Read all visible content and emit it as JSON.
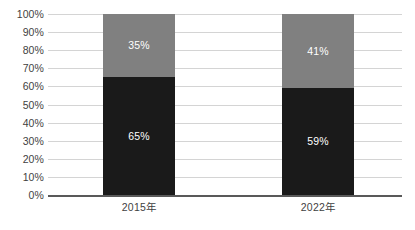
{
  "chart_data": {
    "type": "bar",
    "subtype": "100% stacked column",
    "title": "",
    "subtitle": "",
    "xlabel": "",
    "ylabel": "",
    "categories": [
      "2015年",
      "2022年"
    ],
    "series": [
      {
        "name": "dark-segment",
        "color": "#1a1a1a",
        "values": [
          65,
          59
        ],
        "labels": [
          "65%",
          "41%"
        ]
      },
      {
        "name": "gray-segment",
        "color": "#808080",
        "values": [
          35,
          41
        ],
        "labels": [
          "35%",
          "41%"
        ]
      }
    ],
    "bars": [
      {
        "category": "2015年",
        "segments": [
          {
            "name": "dark-segment",
            "value": 65,
            "label": "65%",
            "color": "#1a1a1a"
          },
          {
            "name": "gray-segment",
            "value": 35,
            "label": "35%",
            "color": "#808080"
          }
        ]
      },
      {
        "category": "2022年",
        "segments": [
          {
            "name": "dark-segment",
            "value": 59,
            "label": "59%",
            "color": "#1a1a1a"
          },
          {
            "name": "gray-segment",
            "value": 41,
            "label": "41%",
            "color": "#808080"
          }
        ]
      }
    ],
    "ylim": [
      0,
      100
    ],
    "y_tick_step": 10,
    "y_ticks": [
      {
        "value": 100,
        "label": "100%"
      },
      {
        "value": 90,
        "label": "90%"
      },
      {
        "value": 80,
        "label": "80%"
      },
      {
        "value": 70,
        "label": "70%"
      },
      {
        "value": 60,
        "label": "60%"
      },
      {
        "value": 50,
        "label": "50%"
      },
      {
        "value": 40,
        "label": "40%"
      },
      {
        "value": 30,
        "label": "30%"
      },
      {
        "value": 20,
        "label": "20%"
      },
      {
        "value": 10,
        "label": "10%"
      },
      {
        "value": 0,
        "label": "0%"
      }
    ],
    "grid": true,
    "legend": false,
    "legend_position": "none",
    "annotations": [],
    "colors": {
      "background": "#ffffff",
      "gridline": "#d4d4d4",
      "axis_line": "#595959",
      "tick_text": "#3f3f3f",
      "data_label_text": "#ffffff",
      "dark_segment": "#1a1a1a",
      "gray_segment": "#808080"
    }
  }
}
